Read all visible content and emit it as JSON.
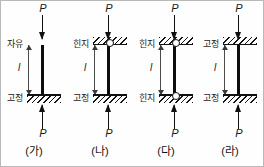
{
  "figure": {
    "load_symbol": "P",
    "length_symbol": "l",
    "border_color": "#b9b9b9",
    "line_color": "#111111"
  },
  "labels": {
    "free": "자유",
    "hinge": "힌지",
    "fixed": "고정"
  },
  "cases": [
    {
      "caption": "(가)",
      "top_support": "자유",
      "bottom_support": "고정",
      "top_has_hatch": false,
      "top_has_pin": false,
      "bottom_has_hatch": true,
      "bottom_has_pin": false,
      "load_top": "P",
      "load_bottom": "P",
      "length": "l"
    },
    {
      "caption": "(나)",
      "top_support": "힌지",
      "bottom_support": "고정",
      "top_has_hatch": true,
      "top_has_pin": true,
      "bottom_has_hatch": true,
      "bottom_has_pin": false,
      "load_top": "P",
      "load_bottom": "P",
      "length": "l"
    },
    {
      "caption": "(다)",
      "top_support": "힌지",
      "bottom_support": "힌지",
      "top_has_hatch": true,
      "top_has_pin": true,
      "bottom_has_hatch": true,
      "bottom_has_pin": true,
      "load_top": "P",
      "load_bottom": "P",
      "length": "l"
    },
    {
      "caption": "(라)",
      "top_support": "고정",
      "bottom_support": "고정",
      "top_has_hatch": true,
      "top_has_pin": false,
      "bottom_has_hatch": true,
      "bottom_has_pin": false,
      "load_top": "P",
      "load_bottom": "P",
      "length": "l"
    }
  ]
}
